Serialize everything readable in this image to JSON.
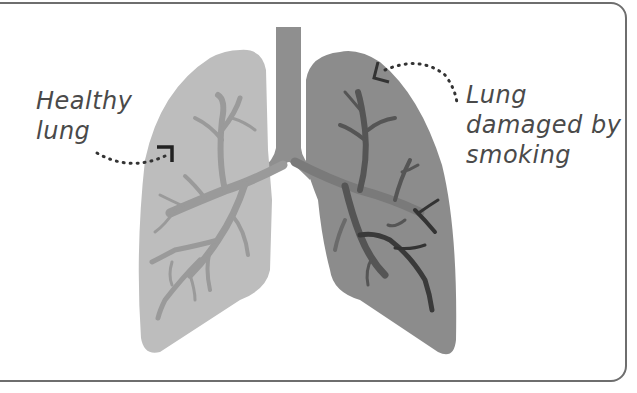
{
  "figure": {
    "type": "labeled-illustration",
    "colors": {
      "border": "#6e6e6e",
      "healthy_lung": "#bdbdbd",
      "healthy_airways": "#9a9a9a",
      "damaged_lung": "#8c8c8c",
      "damaged_airways": "#4a4a4a",
      "trachea": "#8f8f8f",
      "label_text": "#4a4a4a",
      "arrow": "#333333"
    }
  },
  "labels": {
    "healthy": {
      "line1": "Healthy",
      "line2": "lung"
    },
    "damaged": {
      "line1": "Lung",
      "line2": "damaged by",
      "line3": "smoking"
    }
  }
}
